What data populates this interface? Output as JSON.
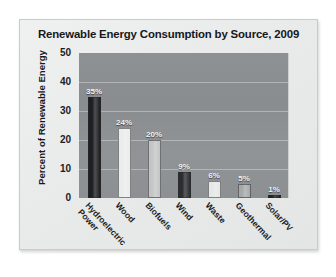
{
  "card": {
    "title": "Renewable Energy Consumption by Source, 2009"
  },
  "chart_data": {
    "type": "bar",
    "title": "Renewable Energy Consumption by Source, 2009",
    "xlabel": "",
    "ylabel": "Percent of Renewable Energy",
    "ylim": [
      0,
      50
    ],
    "ytick_labels": [
      "50",
      "40",
      "30",
      "20",
      "10",
      "0"
    ],
    "yticks": [
      50,
      40,
      30,
      20,
      10,
      0
    ],
    "gridlines": [
      40,
      30,
      20,
      10
    ],
    "grid": true,
    "legend": false,
    "categories": [
      "Hydroelectric\nPower",
      "Wood",
      "Biofuels",
      "Wind",
      "Waste",
      "Geothermal",
      "Solar/PV"
    ],
    "values": [
      35,
      24,
      20,
      9,
      6,
      5,
      1
    ],
    "data_labels": [
      "35%",
      "24%",
      "20%",
      "9%",
      "6%",
      "5%",
      "1%"
    ],
    "bar_colors": [
      "#1d1f21",
      "#ebecec",
      "#c3c5c6",
      "#2b2d2f",
      "#e6e7e7",
      "#a6a9aa",
      "#1f2123"
    ],
    "plot_background": "#8d9092",
    "gridline_color": "#b9bcbd",
    "card_background": "#eaebeb",
    "label_color": "#f2f3f3",
    "axis_text_color": "#1b1d1f"
  }
}
